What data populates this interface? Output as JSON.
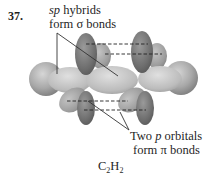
{
  "problem_number": "37.",
  "labels": {
    "sigma_line1_italic": "sp",
    "sigma_line1_rest": " hybrids",
    "sigma_line2_pre": "form ",
    "sigma_line2_symbol": "σ",
    "sigma_line2_post": " bonds",
    "pi_line1_pre": "Two ",
    "pi_line1_italic": "p",
    "pi_line1_post": " orbitals",
    "pi_line2_pre": "form ",
    "pi_line2_symbol": "π",
    "pi_line2_post": " bonds"
  },
  "caption": {
    "c": "C",
    "c_sub": "2",
    "h": "H",
    "h_sub": "2"
  },
  "colors": {
    "background": "#ffffff",
    "p_orbital_dark": "#6e6e6e",
    "p_orbital_light": "#9a9a9a",
    "sigma_orbital": "#bdbdbd",
    "hydrogen_sphere": "#a8a8a8",
    "leader_line": "#333333",
    "dashed_line": "#222222",
    "text": "#1f1f1f"
  }
}
